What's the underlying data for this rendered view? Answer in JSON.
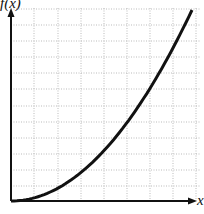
{
  "chart_data": {
    "type": "line",
    "title": "",
    "xlabel": "x",
    "ylabel": "f(x)",
    "grid": true,
    "legend": null,
    "xlim": [
      0,
      1
    ],
    "ylim": [
      0,
      1
    ],
    "series": [
      {
        "name": "f(x)",
        "x": [
          0,
          0.1,
          0.2,
          0.3,
          0.4,
          0.5,
          0.6,
          0.7,
          0.8,
          0.9,
          1.0
        ],
        "values": [
          0,
          0.01,
          0.04,
          0.09,
          0.16,
          0.25,
          0.36,
          0.49,
          0.64,
          0.81,
          1.0
        ]
      }
    ],
    "color": "#111111"
  },
  "labels": {
    "y_axis": "f(x)",
    "x_axis": "x"
  }
}
